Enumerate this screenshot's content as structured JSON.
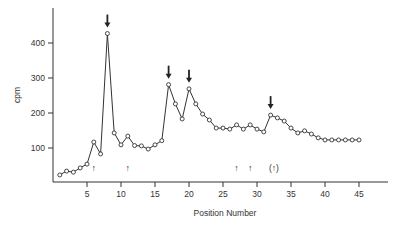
{
  "chart_data": {
    "type": "line",
    "title": "",
    "xlabel": "Position Number",
    "ylabel": "cpm",
    "xlim": [
      0,
      49
    ],
    "ylim": [
      0,
      500
    ],
    "x_ticks": [
      5,
      10,
      15,
      20,
      25,
      30,
      35,
      40,
      45
    ],
    "y_ticks": [
      100,
      200,
      300,
      400
    ],
    "grid": false,
    "legend": null,
    "series": [
      {
        "name": "cpm",
        "marker": "open-circle",
        "x": [
          1,
          2,
          3,
          4,
          5,
          6,
          7,
          8,
          9,
          10,
          11,
          12,
          13,
          14,
          15,
          16,
          17,
          18,
          19,
          20,
          21,
          22,
          23,
          24,
          25,
          26,
          27,
          28,
          29,
          30,
          31,
          32,
          33,
          34,
          35,
          36,
          37,
          38,
          39,
          40,
          41,
          42,
          43,
          44,
          45
        ],
        "values": [
          23,
          34,
          31,
          43,
          54,
          117,
          83,
          427,
          143,
          109,
          134,
          107,
          106,
          97,
          109,
          121,
          281,
          226,
          183,
          269,
          226,
          197,
          180,
          157,
          157,
          154,
          166,
          154,
          166,
          154,
          146,
          194,
          186,
          177,
          157,
          143,
          149,
          140,
          129,
          123,
          123,
          123,
          123,
          123,
          123
        ]
      }
    ],
    "annotations": [
      {
        "type": "down-arrow",
        "x": 8,
        "label": "major peak"
      },
      {
        "type": "down-arrow",
        "x": 17,
        "label": "peak"
      },
      {
        "type": "down-arrow",
        "x": 20,
        "label": "peak"
      },
      {
        "type": "down-arrow",
        "x": 32,
        "label": "peak"
      },
      {
        "type": "up-arrow",
        "x": 6,
        "text": "↑"
      },
      {
        "type": "up-arrow",
        "x": 11,
        "text": "↑"
      },
      {
        "type": "up-arrow",
        "x": 27,
        "text": "↑"
      },
      {
        "type": "up-arrow",
        "x": 29,
        "text": "↑"
      },
      {
        "type": "up-arrow-parenthesized",
        "x": 32.5,
        "text": "(↑)"
      }
    ]
  },
  "colors": {
    "ink": "#333333",
    "background": "#ffffff"
  }
}
